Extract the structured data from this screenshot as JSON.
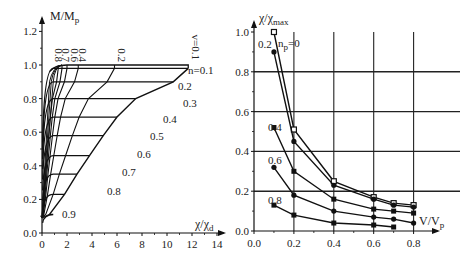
{
  "chart_data": [
    {
      "type": "line",
      "title": "",
      "xlabel": "χ/χd",
      "ylabel": "M/Mp",
      "xlim": [
        0,
        14
      ],
      "ylim": [
        0,
        1.2
      ],
      "x_ticks": [
        "0",
        "2",
        "4",
        "6",
        "8",
        "10",
        "12",
        "14"
      ],
      "y_ticks": [
        "0.0",
        "0.2",
        "0.4",
        "0.6",
        "0.8",
        "1.0",
        "1.2"
      ],
      "grid": false,
      "description": "Moment-curvature interaction curves for axial load ratios n and shear ratios v",
      "n_series": [
        {
          "name": "n=0.1",
          "plateau": 0.98,
          "end_x": 11.7
        },
        {
          "name": "0.2",
          "plateau": 0.9,
          "end_x": 10.5
        },
        {
          "name": "0.3",
          "plateau": 0.8,
          "end_x": 7.5
        },
        {
          "name": "0.4",
          "plateau": 0.69,
          "end_x": 6.0
        },
        {
          "name": "0.5",
          "plateau": 0.58,
          "end_x": 4.9
        },
        {
          "name": "0.6",
          "plateau": 0.46,
          "end_x": 3.8
        },
        {
          "name": "0.7",
          "plateau": 0.35,
          "end_x": 2.8
        },
        {
          "name": "0.8",
          "plateau": 0.23,
          "end_x": 1.8
        },
        {
          "name": "0.9",
          "plateau": 0.11,
          "end_x": 0.6
        }
      ],
      "v_series": [
        {
          "name": "v=0.1",
          "top_x": 11.7
        },
        {
          "name": "0.2",
          "top_x": 5.8
        },
        {
          "name": "0.4",
          "top_x": 2.9
        },
        {
          "name": "0.6",
          "top_x": 2.0
        },
        {
          "name": "0.7",
          "top_x": 1.6
        },
        {
          "name": "0.8",
          "top_x": 1.3
        }
      ],
      "envelope_top": 1.0
    },
    {
      "type": "line",
      "title": "",
      "xlabel": "V/Vp",
      "ylabel": "χ/χmax",
      "xlim": [
        0,
        0.9
      ],
      "ylim": [
        0,
        1.05
      ],
      "x_ticks": [
        "0.0",
        "0.2",
        "0.4",
        "0.6",
        "0.8"
      ],
      "y_ticks": [
        "0.0",
        "0.2",
        "0.4",
        "0.6",
        "0.8",
        "1.0"
      ],
      "grid": true,
      "legend_position": "inline labels",
      "x": [
        0.1,
        0.2,
        0.4,
        0.6,
        0.7,
        0.8
      ],
      "series": [
        {
          "name": "np=0",
          "marker": "open-square",
          "values": [
            1.0,
            0.51,
            0.25,
            0.17,
            0.14,
            0.13
          ]
        },
        {
          "name": "0.2",
          "marker": "filled-circle",
          "values": [
            0.9,
            0.45,
            0.23,
            0.16,
            0.13,
            0.12
          ]
        },
        {
          "name": "0.4",
          "marker": "filled-square",
          "values": [
            0.52,
            0.3,
            0.16,
            0.11,
            0.1,
            0.09
          ]
        },
        {
          "name": "0.6",
          "marker": "filled-circle",
          "values": [
            0.32,
            0.18,
            0.1,
            0.07,
            0.06,
            0.04
          ]
        },
        {
          "name": "0.8",
          "marker": "filled-square",
          "values": [
            0.13,
            0.08,
            0.04,
            0.03,
            0.02,
            null
          ]
        }
      ]
    }
  ],
  "left": {
    "ylabel_main": "M/M",
    "ylabel_sub": "p",
    "xlabel_main": "χ/χ",
    "xlabel_sub": "d",
    "v_labels": [
      "0.8",
      "0.7",
      "0.6",
      "0.4",
      "0.2",
      "v=0.1"
    ],
    "n_labels": [
      "n=0.1",
      "0.2",
      "0.3",
      "0.4",
      "0.5",
      "0.6",
      "0.7",
      "0.8",
      "0.9"
    ]
  },
  "right": {
    "ylabel_main": "χ/χ",
    "ylabel_sub": "max",
    "xlabel_main": "V/V",
    "xlabel_sub": "p",
    "series_labels": [
      "0.2",
      "n",
      "p",
      "=0",
      "0.4",
      "0.6",
      "0.8"
    ]
  }
}
